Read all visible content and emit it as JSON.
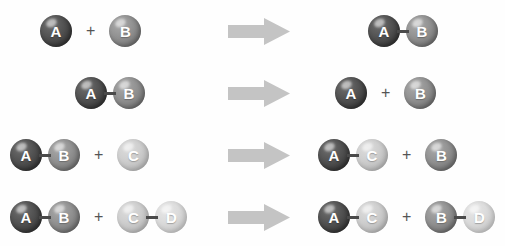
{
  "diagram": {
    "background_color": "#fefefe",
    "arrow_color": "#c4c4c4",
    "bond_color": "#4a4a4a",
    "plus_symbol": "+",
    "arrow_symbol": "right-block-arrow"
  },
  "atom_types": {
    "A": {
      "label": "A",
      "color": "#3f3f3f",
      "label_color": "#ffffff"
    },
    "B": {
      "label": "B",
      "color": "#7d7d7d",
      "label_color": "#ffffff"
    },
    "C": {
      "label": "C",
      "color": "#bdbdbd",
      "label_color": "#ffffff"
    },
    "D": {
      "label": "D",
      "color": "#cacaca",
      "label_color": "#ffffff"
    }
  },
  "reactions": [
    {
      "name": "synthesis",
      "reactants": [
        {
          "atoms": [
            "A"
          ]
        },
        {
          "atoms": [
            "B"
          ]
        }
      ],
      "products": [
        {
          "atoms": [
            "A",
            "B"
          ]
        }
      ],
      "left_offset": 40,
      "right_offset": 68
    },
    {
      "name": "decomposition",
      "reactants": [
        {
          "atoms": [
            "A",
            "B"
          ]
        }
      ],
      "products": [
        {
          "atoms": [
            "A"
          ]
        },
        {
          "atoms": [
            "B"
          ]
        }
      ],
      "left_offset": 75,
      "right_offset": 35
    },
    {
      "name": "single-displacement",
      "reactants": [
        {
          "atoms": [
            "A",
            "B"
          ]
        },
        {
          "atoms": [
            "C"
          ]
        }
      ],
      "products": [
        {
          "atoms": [
            "A",
            "C"
          ]
        },
        {
          "atoms": [
            "B"
          ]
        }
      ],
      "left_offset": 10,
      "right_offset": 18
    },
    {
      "name": "double-displacement",
      "reactants": [
        {
          "atoms": [
            "A",
            "B"
          ]
        },
        {
          "atoms": [
            "C",
            "D"
          ]
        }
      ],
      "products": [
        {
          "atoms": [
            "A",
            "C"
          ]
        },
        {
          "atoms": [
            "B",
            "D"
          ]
        }
      ],
      "left_offset": 10,
      "right_offset": 18
    }
  ],
  "row_tops": [
    0,
    62,
    124,
    186
  ]
}
